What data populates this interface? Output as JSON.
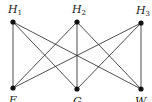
{
  "diagram": {
    "type": "complete-bipartite-graph",
    "top_nodes": [
      {
        "id": "H1",
        "label": "H",
        "sub": "1",
        "x": 13,
        "y": 22
      },
      {
        "id": "H2",
        "label": "H",
        "sub": "2",
        "x": 77,
        "y": 22
      },
      {
        "id": "H3",
        "label": "H",
        "sub": "3",
        "x": 141,
        "y": 23
      }
    ],
    "bottom_nodes": [
      {
        "id": "E",
        "label": "E",
        "x": 13,
        "y": 88
      },
      {
        "id": "G",
        "label": "G",
        "x": 77,
        "y": 89
      },
      {
        "id": "W",
        "label": "W",
        "x": 141,
        "y": 89
      }
    ],
    "edges": [
      [
        "H1",
        "E"
      ],
      [
        "H1",
        "G"
      ],
      [
        "H1",
        "W"
      ],
      [
        "H2",
        "E"
      ],
      [
        "H2",
        "G"
      ],
      [
        "H2",
        "W"
      ],
      [
        "H3",
        "E"
      ],
      [
        "H3",
        "G"
      ],
      [
        "H3",
        "W"
      ]
    ],
    "colors": {
      "line": "#222222",
      "node": "#111111",
      "background": "#ffffff"
    }
  }
}
